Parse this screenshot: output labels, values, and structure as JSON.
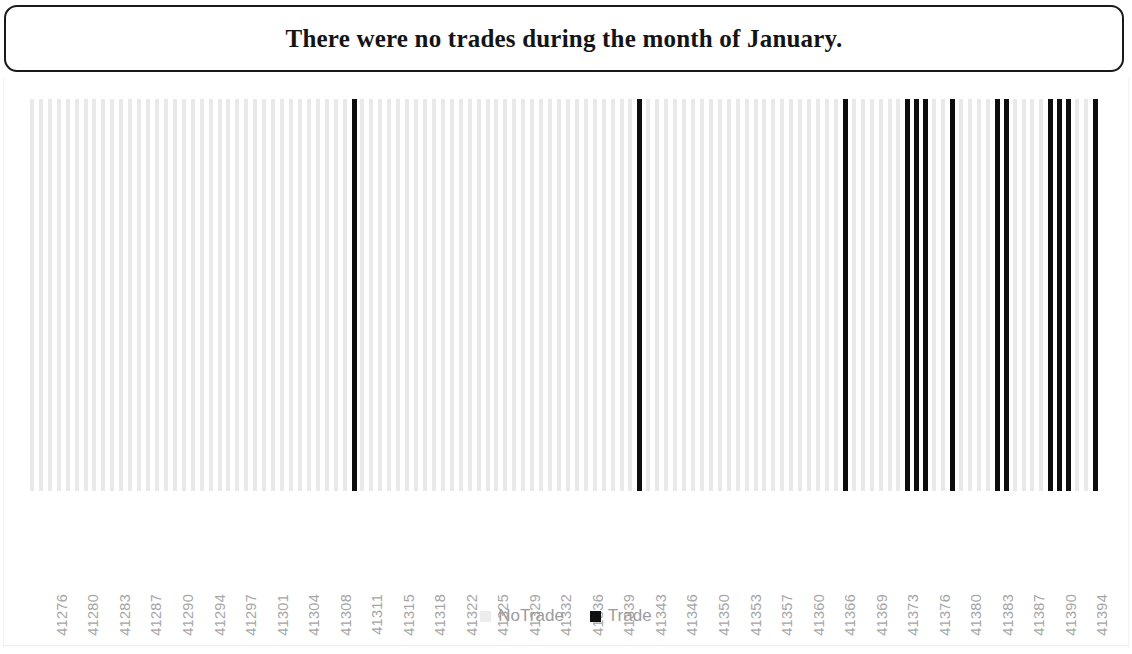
{
  "chart_title": "There were no trades during the month of January.",
  "legend": {
    "items": [
      {
        "label": "NoTrade",
        "color": "#ececec",
        "marker": "square"
      },
      {
        "label": "Trade",
        "color": "#111111",
        "marker": "square"
      }
    ]
  },
  "axis": {
    "tick_labels": [
      "41276",
      "41280",
      "41283",
      "41287",
      "41290",
      "41294",
      "41297",
      "41301",
      "41304",
      "41308",
      "41311",
      "41315",
      "41318",
      "41322",
      "41325",
      "41329",
      "41332",
      "41336",
      "41339",
      "41343",
      "41346",
      "41350",
      "41353",
      "41357",
      "41360",
      "41366",
      "41369",
      "41373",
      "41376",
      "41380",
      "41383",
      "41387",
      "41390",
      "41394"
    ]
  },
  "chart_data": {
    "type": "bar",
    "title": "There were no trades during the month of January.",
    "xlabel": "",
    "ylabel": "",
    "ylim": [
      0,
      1
    ],
    "grid": false,
    "legend_position": "bottom",
    "note": "Binary indicator bar chart: each category is one serial date; value 1 drawn full height. Color encodes NoTrade (light gray) vs Trade (black).",
    "x_tick_labels": [
      "41276",
      "41280",
      "41283",
      "41287",
      "41290",
      "41294",
      "41297",
      "41301",
      "41304",
      "41308",
      "41311",
      "41315",
      "41318",
      "41322",
      "41325",
      "41329",
      "41332",
      "41336",
      "41339",
      "41343",
      "41346",
      "41350",
      "41353",
      "41357",
      "41360",
      "41366",
      "41369",
      "41373",
      "41376",
      "41380",
      "41383",
      "41387",
      "41390",
      "41394"
    ],
    "categories": [
      41275,
      41276,
      41277,
      41278,
      41279,
      41280,
      41281,
      41282,
      41283,
      41284,
      41285,
      41286,
      41287,
      41288,
      41289,
      41290,
      41291,
      41292,
      41293,
      41294,
      41295,
      41296,
      41297,
      41298,
      41299,
      41300,
      41301,
      41302,
      41303,
      41304,
      41305,
      41306,
      41307,
      41308,
      41309,
      41310,
      41311,
      41312,
      41313,
      41314,
      41315,
      41316,
      41317,
      41318,
      41319,
      41320,
      41321,
      41322,
      41323,
      41324,
      41325,
      41326,
      41327,
      41328,
      41329,
      41330,
      41331,
      41332,
      41333,
      41334,
      41335,
      41336,
      41337,
      41338,
      41339,
      41340,
      41341,
      41342,
      41343,
      41344,
      41345,
      41346,
      41347,
      41348,
      41349,
      41350,
      41351,
      41352,
      41353,
      41354,
      41355,
      41356,
      41357,
      41358,
      41359,
      41360,
      41361,
      41362,
      41363,
      41364,
      41365,
      41366,
      41367,
      41368,
      41369,
      41370,
      41371,
      41372,
      41373,
      41374,
      41375,
      41376,
      41377,
      41378,
      41379,
      41380,
      41381,
      41382,
      41383,
      41384,
      41385,
      41386,
      41387,
      41388,
      41389,
      41390,
      41391,
      41392,
      41393,
      41394
    ],
    "series": [
      {
        "name": "NoTrade",
        "color": "#ececec",
        "values": [
          1,
          1,
          1,
          1,
          1,
          1,
          1,
          1,
          1,
          1,
          1,
          1,
          1,
          1,
          1,
          1,
          1,
          1,
          1,
          1,
          1,
          1,
          1,
          1,
          1,
          1,
          1,
          1,
          1,
          1,
          1,
          1,
          1,
          1,
          1,
          1,
          0,
          1,
          1,
          1,
          1,
          1,
          1,
          1,
          1,
          1,
          1,
          1,
          1,
          1,
          1,
          1,
          1,
          1,
          1,
          1,
          1,
          1,
          1,
          1,
          1,
          1,
          1,
          1,
          1,
          1,
          1,
          1,
          0,
          1,
          1,
          1,
          1,
          1,
          1,
          1,
          1,
          1,
          1,
          1,
          1,
          1,
          1,
          1,
          1,
          1,
          1,
          1,
          1,
          1,
          1,
          0,
          1,
          1,
          1,
          1,
          1,
          1,
          0,
          0,
          0,
          1,
          1,
          0,
          1,
          1,
          1,
          1,
          0,
          0,
          1,
          1,
          1,
          1,
          0,
          0,
          0,
          1,
          1,
          0
        ],
        "notes": "Light gray bars occupy every date except those flagged as Trade"
      },
      {
        "name": "Trade",
        "color": "#111111",
        "values": [
          0,
          0,
          0,
          0,
          0,
          0,
          0,
          0,
          0,
          0,
          0,
          0,
          0,
          0,
          0,
          0,
          0,
          0,
          0,
          0,
          0,
          0,
          0,
          0,
          0,
          0,
          0,
          0,
          0,
          0,
          0,
          0,
          0,
          0,
          0,
          0,
          1,
          0,
          0,
          0,
          0,
          0,
          0,
          0,
          0,
          0,
          0,
          0,
          0,
          0,
          0,
          0,
          0,
          0,
          0,
          0,
          0,
          0,
          0,
          0,
          0,
          0,
          0,
          0,
          0,
          0,
          0,
          0,
          1,
          0,
          0,
          0,
          0,
          0,
          0,
          0,
          0,
          0,
          0,
          0,
          0,
          0,
          0,
          0,
          0,
          0,
          0,
          0,
          0,
          0,
          0,
          1,
          0,
          0,
          0,
          0,
          0,
          0,
          1,
          1,
          1,
          0,
          0,
          1,
          0,
          0,
          0,
          0,
          1,
          1,
          0,
          0,
          0,
          0,
          1,
          1,
          1,
          0,
          0,
          1
        ],
        "trade_dates": [
          41311,
          41343,
          41366,
          41373,
          41374,
          41375,
          41378,
          41383,
          41384,
          41389,
          41390,
          41391,
          41394
        ]
      }
    ]
  }
}
